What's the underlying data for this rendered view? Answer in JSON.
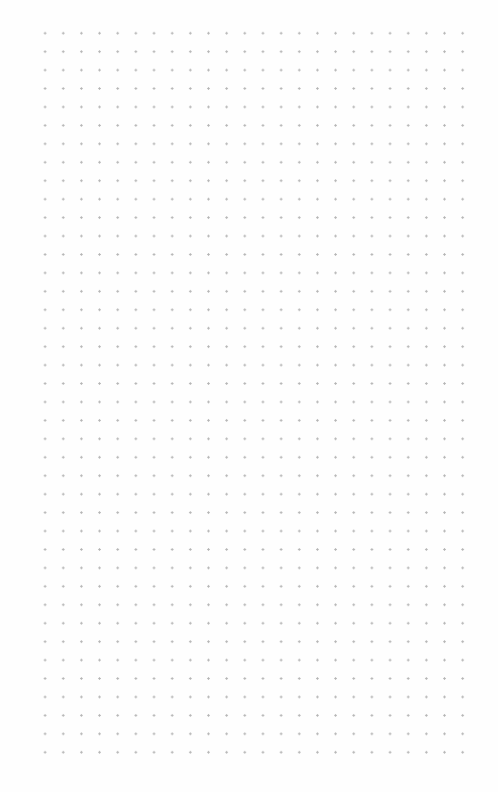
{
  "page": {
    "type": "dot-grid-paper",
    "background_color": "#fefefe",
    "dot_color": "#b4b4b4",
    "dot_spacing_px": 18.4,
    "grid_origin": [
      37,
      25
    ],
    "columns": 24,
    "rows": 41
  }
}
